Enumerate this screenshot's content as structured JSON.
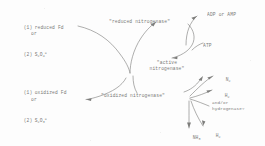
{
  "diagram": {
    "type": "biochemical-cycle-schematic",
    "ink_color": "#70706e",
    "background_color": "#fdfdfd"
  },
  "reductant_group": {
    "item1_number": "(1)",
    "item1_label": "reduced Fd",
    "connector": "or",
    "item2_number": "(2)",
    "item2_label_base": "S",
    "item2_sub1": "2",
    "item2_label_mid": "O",
    "item2_sub2": "4",
    "item2_sup": "="
  },
  "oxidant_group": {
    "item1_number": "(1)",
    "item1_label": "oxidized Fd",
    "connector": "or",
    "item2_number": "(2)",
    "item2_label_base": "S",
    "item2_sub1": "2",
    "item2_label_mid": "O",
    "item2_sub2": "3",
    "item2_sup": "="
  },
  "states": {
    "reduced_nitrogenase": "\"reduced nitrogenase\"",
    "oxidized_nitrogenase": "\"oxidized nitrogenase\"",
    "active_nitrogenase_line1": "\"active",
    "active_nitrogenase_line2": "nitrogenase\""
  },
  "energy": {
    "products": "ADP or AMP",
    "substrate": "ATP"
  },
  "substrates": {
    "n2_base": "N",
    "n2_sub": "2",
    "h2_top_base": "H",
    "h2_top_sub": "2",
    "note_line1": "and/or",
    "note_line2": "hydrogenase?",
    "nh3_base": "NH",
    "nh3_sub": "3",
    "h2_bottom_base": "H",
    "h2_bottom_sub": "2"
  }
}
